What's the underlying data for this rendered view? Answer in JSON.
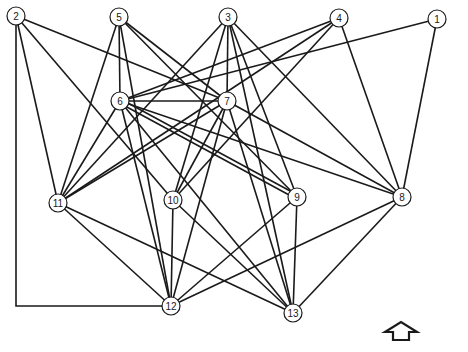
{
  "diagram": {
    "type": "undirected-graph",
    "colors": {
      "edge": "#1a1a1a",
      "node_fill": "#ffffff",
      "node_stroke": "#1a1a1a",
      "background": "#ffffff"
    },
    "node_radius": 9,
    "nodes": [
      {
        "id": "1",
        "label": "1",
        "x": 437,
        "y": 19
      },
      {
        "id": "2",
        "label": "2",
        "x": 16,
        "y": 16
      },
      {
        "id": "3",
        "label": "3",
        "x": 228,
        "y": 17
      },
      {
        "id": "4",
        "label": "4",
        "x": 339,
        "y": 18
      },
      {
        "id": "5",
        "label": "5",
        "x": 119,
        "y": 17
      },
      {
        "id": "6",
        "label": "6",
        "x": 120,
        "y": 101
      },
      {
        "id": "7",
        "label": "7",
        "x": 227,
        "y": 101
      },
      {
        "id": "8",
        "label": "8",
        "x": 402,
        "y": 197
      },
      {
        "id": "9",
        "label": "9",
        "x": 297,
        "y": 197
      },
      {
        "id": "10",
        "label": "10",
        "x": 173,
        "y": 200
      },
      {
        "id": "11",
        "label": "11",
        "x": 58,
        "y": 203
      },
      {
        "id": "12",
        "label": "12",
        "x": 171,
        "y": 306
      },
      {
        "id": "13",
        "label": "13",
        "x": 293,
        "y": 313
      }
    ],
    "edges": [
      {
        "from": "1",
        "to": "6"
      },
      {
        "from": "1",
        "to": "8"
      },
      {
        "from": "2",
        "to": "11"
      },
      {
        "from": "2",
        "to": "7"
      },
      {
        "from": "2",
        "to": "10"
      },
      {
        "from": "2",
        "to": "12",
        "route": [
          [
            16,
            16
          ],
          [
            16,
            306
          ],
          [
            171,
            306
          ]
        ]
      },
      {
        "from": "3",
        "to": "11"
      },
      {
        "from": "3",
        "to": "7"
      },
      {
        "from": "3",
        "to": "10"
      },
      {
        "from": "3",
        "to": "9"
      },
      {
        "from": "3",
        "to": "13"
      },
      {
        "from": "3",
        "to": "8"
      },
      {
        "from": "4",
        "to": "6"
      },
      {
        "from": "4",
        "to": "11"
      },
      {
        "from": "4",
        "to": "10"
      },
      {
        "from": "4",
        "to": "8"
      },
      {
        "from": "5",
        "to": "6"
      },
      {
        "from": "5",
        "to": "11"
      },
      {
        "from": "5",
        "to": "7"
      },
      {
        "from": "5",
        "to": "12"
      },
      {
        "from": "5",
        "to": "9"
      },
      {
        "from": "6",
        "to": "7"
      },
      {
        "from": "6",
        "to": "11"
      },
      {
        "from": "6",
        "to": "12"
      },
      {
        "from": "6",
        "to": "9",
        "offset": -2
      },
      {
        "from": "6",
        "to": "9",
        "offset": 2
      },
      {
        "from": "6",
        "to": "8"
      },
      {
        "from": "6",
        "to": "13"
      },
      {
        "from": "7",
        "to": "11"
      },
      {
        "from": "7",
        "to": "10"
      },
      {
        "from": "7",
        "to": "12"
      },
      {
        "from": "7",
        "to": "13"
      },
      {
        "from": "7",
        "to": "8"
      },
      {
        "from": "8",
        "to": "12"
      },
      {
        "from": "8",
        "to": "13"
      },
      {
        "from": "9",
        "to": "12"
      },
      {
        "from": "9",
        "to": "13"
      },
      {
        "from": "10",
        "to": "12"
      },
      {
        "from": "10",
        "to": "13"
      },
      {
        "from": "11",
        "to": "12"
      },
      {
        "from": "11",
        "to": "13"
      }
    ],
    "arrow": {
      "icon": "up-arrow-outline",
      "points": [
        [
          393,
          340
        ],
        [
          393,
          332
        ],
        [
          385,
          332
        ],
        [
          401,
          322
        ],
        [
          417,
          332
        ],
        [
          409,
          332
        ],
        [
          409,
          340
        ]
      ]
    }
  }
}
